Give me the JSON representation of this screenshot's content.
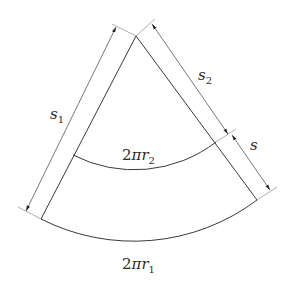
{
  "diagram": {
    "labels": {
      "s1": {
        "base": "s",
        "sub": "1"
      },
      "s2": {
        "base": "s",
        "sub": "2"
      },
      "s": {
        "base": "s"
      },
      "inner_arc": {
        "prefix": "2",
        "pi": "π",
        "var": "r",
        "sub": "2"
      },
      "outer_arc": {
        "prefix": "2",
        "pi": "π",
        "var": "r",
        "sub": "1"
      }
    },
    "colors": {
      "main_line": "#3a3a3a",
      "dimension_line": "#555555",
      "extension_line": "#9a9a9a",
      "text": "#2b2b2b",
      "background": "#ffffff"
    }
  }
}
